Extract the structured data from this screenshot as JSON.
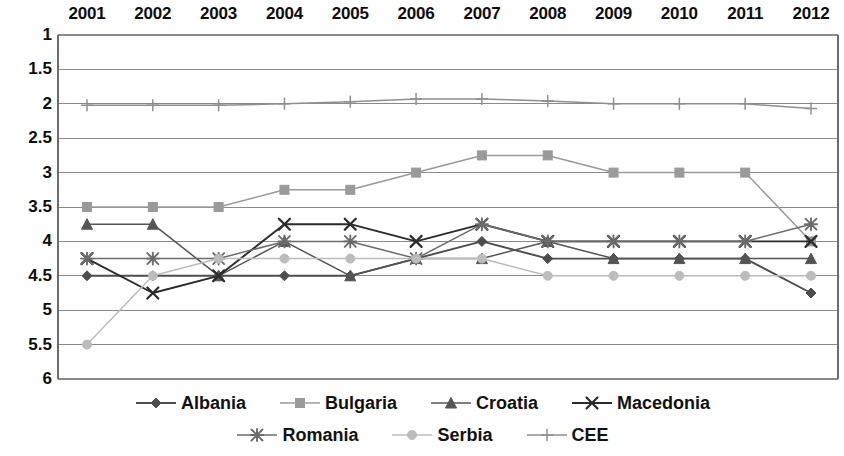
{
  "chart_data": {
    "type": "line",
    "title": "",
    "subtitle": "",
    "xlabel": "",
    "ylabel": "",
    "categories": [
      "2001",
      "2002",
      "2003",
      "2004",
      "2005",
      "2006",
      "2007",
      "2008",
      "2009",
      "2010",
      "2011",
      "2012"
    ],
    "x_axis_position": "top",
    "y_axis_inverted": true,
    "ylim": [
      1,
      6
    ],
    "y_ticks": [
      "1",
      "1.5",
      "2",
      "2.5",
      "3",
      "3.5",
      "4",
      "4.5",
      "5",
      "5.5",
      "6"
    ],
    "y_tick_values": [
      1,
      1.5,
      2,
      2.5,
      3,
      3.5,
      4,
      4.5,
      5,
      5.5,
      6
    ],
    "grid": true,
    "grid_axis": "y",
    "legend_position": "bottom",
    "series": [
      {
        "name": "Albania",
        "marker": "diamond",
        "color": "#4d4d4d",
        "values": [
          4.5,
          4.5,
          4.5,
          4.5,
          4.5,
          4.25,
          4.0,
          4.25,
          4.25,
          4.25,
          4.25,
          4.75
        ]
      },
      {
        "name": "Bulgaria",
        "marker": "square",
        "color": "#9a9a9a",
        "values": [
          3.5,
          3.5,
          3.5,
          3.25,
          3.25,
          3.0,
          2.75,
          2.75,
          3.0,
          3.0,
          3.0,
          4.0
        ]
      },
      {
        "name": "Croatia",
        "marker": "triangle",
        "color": "#545454",
        "values": [
          3.75,
          3.75,
          4.5,
          4.0,
          4.5,
          4.25,
          4.25,
          4.0,
          4.25,
          4.25,
          4.25,
          4.25
        ]
      },
      {
        "name": "Macedonia",
        "marker": "cross",
        "color": "#2b2b2b",
        "values": [
          4.25,
          4.75,
          4.5,
          3.75,
          3.75,
          4.0,
          3.75,
          4.0,
          4.0,
          4.0,
          4.0,
          4.0
        ]
      },
      {
        "name": "Romania",
        "marker": "star",
        "color": "#6b6b6b",
        "values": [
          4.25,
          4.25,
          4.25,
          4.0,
          4.0,
          4.25,
          3.75,
          4.0,
          4.0,
          4.0,
          4.0,
          3.75
        ]
      },
      {
        "name": "Serbia",
        "marker": "circle",
        "color": "#bcbcbc",
        "values": [
          5.5,
          4.5,
          4.25,
          4.25,
          4.25,
          4.25,
          4.25,
          4.5,
          4.5,
          4.5,
          4.5,
          4.5
        ]
      },
      {
        "name": "CEE",
        "marker": "plus",
        "color": "#8f8f8f",
        "values": [
          2.02,
          2.02,
          2.02,
          2.0,
          1.97,
          1.93,
          1.93,
          1.96,
          2.0,
          2.0,
          2.0,
          2.07
        ]
      }
    ]
  },
  "legend": {
    "rows": [
      [
        "Albania",
        "Bulgaria",
        "Croatia",
        "Macedonia"
      ],
      [
        "Romania",
        "Serbia",
        "CEE"
      ]
    ]
  },
  "plot": {
    "axis_line_color": "#6d6d6d",
    "grid_line_color": "#8a8a8a",
    "background": "#ffffff"
  }
}
